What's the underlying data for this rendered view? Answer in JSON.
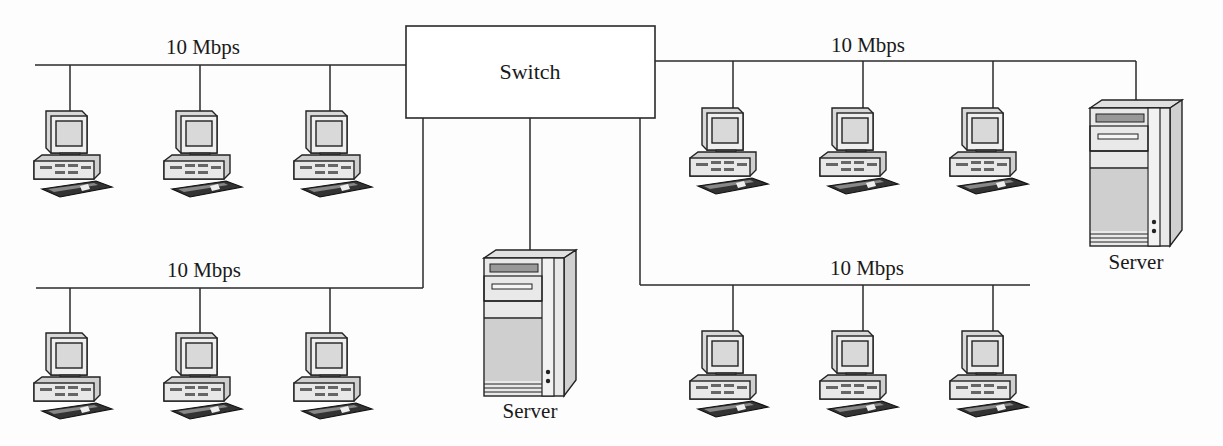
{
  "diagram": {
    "type": "network-topology",
    "switch": {
      "label": "Switch"
    },
    "segments": [
      {
        "id": "top-left",
        "speed_label": "10 Mbps",
        "nodes": [
          "Workstation",
          "Workstation",
          "Workstation"
        ]
      },
      {
        "id": "top-right",
        "speed_label": "10 Mbps",
        "nodes": [
          "Workstation",
          "Workstation",
          "Workstation",
          "Server"
        ]
      },
      {
        "id": "bottom-left",
        "speed_label": "10 Mbps",
        "nodes": [
          "Workstation",
          "Workstation",
          "Workstation"
        ]
      },
      {
        "id": "bottom-right",
        "speed_label": "10 Mbps",
        "nodes": [
          "Workstation",
          "Workstation",
          "Workstation"
        ]
      }
    ],
    "servers": [
      {
        "id": "center-server",
        "label": "Server",
        "connected_to": "Switch"
      },
      {
        "id": "right-server",
        "label": "Server",
        "connected_to": "top-right"
      }
    ],
    "colors": {
      "line": "#2a2a2a",
      "device_fill": "#e6e6e6",
      "device_shade": "#bdbdbd",
      "background": "#fdfdfd"
    }
  }
}
